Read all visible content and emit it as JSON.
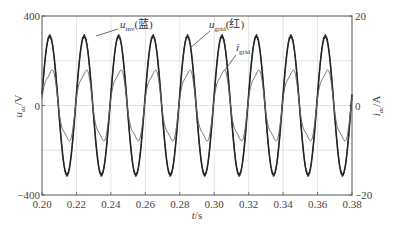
{
  "chart_data": {
    "type": "line",
    "title": "",
    "xlabel": "t/s",
    "ylabel_left": "u_ac/V",
    "ylabel_right": "i_ac/A",
    "xlim": [
      0.2,
      0.38
    ],
    "ylim_left": [
      -400,
      400
    ],
    "ylim_right": [
      -20,
      20
    ],
    "grid": true,
    "x_ticks": [
      "0.20",
      "0.22",
      "0.24",
      "0.26",
      "0.28",
      "0.30",
      "0.32",
      "0.34",
      "0.36",
      "0.38"
    ],
    "y_ticks_left": [
      "400",
      "0",
      "-400"
    ],
    "y_ticks_right": [
      "20",
      "0",
      "-20"
    ],
    "frequency_hz": 50,
    "series": [
      {
        "name": "u_inv (蓝)",
        "axis": "left",
        "amplitude": 310,
        "phase_deg": 0,
        "color": "#333333",
        "note": "inverter voltage, slight ripple at peaks"
      },
      {
        "name": "u_grid (红)",
        "axis": "left",
        "amplitude": 310,
        "phase_deg": 0,
        "color": "#222222",
        "note": "grid voltage overlaps u_inv"
      },
      {
        "name": "i_grid",
        "axis": "right",
        "amplitude": 8,
        "phase_deg": -5,
        "color": "#666666",
        "note": "grid current with distortion near zero crossings"
      }
    ],
    "annotations": [
      {
        "text": "u_inv(蓝)",
        "target": "u_inv peak near t≈0.245"
      },
      {
        "text": "u_grid(红)",
        "target": "u_grid near t≈0.262"
      },
      {
        "text": "i_grid",
        "target": "i_grid near t≈0.283"
      }
    ]
  },
  "labels": {
    "xlabel_main": "t",
    "xlabel_unit": "/s",
    "ylabel_left_main": "u",
    "ylabel_left_sub": "ac",
    "ylabel_left_unit": "/V",
    "ylabel_right_main": "i",
    "ylabel_right_sub": "ac",
    "ylabel_right_unit": "/A",
    "ann_uinv_main": "u",
    "ann_uinv_sub": "inv",
    "ann_uinv_tail": "(蓝)",
    "ann_ugrid_main": "u",
    "ann_ugrid_sub": "grid",
    "ann_ugrid_tail": "(红)",
    "ann_igrid_main": "i",
    "ann_igrid_sub": "grid"
  }
}
